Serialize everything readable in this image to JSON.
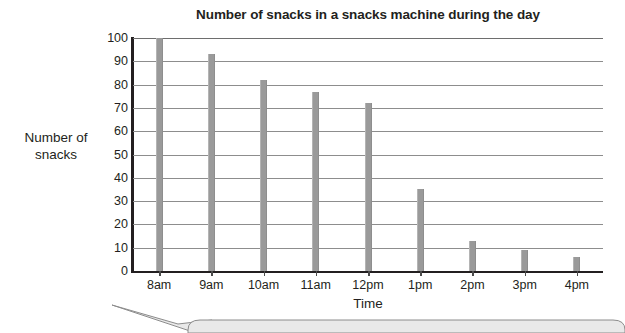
{
  "chart_data": {
    "type": "bar",
    "title": "Number of snacks in a snacks machine during the day",
    "xlabel": "Time",
    "ylabel": "Number of snacks",
    "ylabel_lines": [
      "Number of",
      "snacks"
    ],
    "categories": [
      "8am",
      "9am",
      "10am",
      "11am",
      "12pm",
      "1pm",
      "2pm",
      "3pm",
      "4pm"
    ],
    "values": [
      100,
      93,
      82,
      77,
      72,
      35,
      13,
      9,
      6
    ],
    "ylim": [
      0,
      100
    ],
    "ytick_step": 10,
    "yticks": [
      100,
      90,
      80,
      70,
      60,
      50,
      40,
      30,
      20,
      10,
      0
    ],
    "grid": true,
    "legend": null,
    "bar_color": "#9a9a9a",
    "axis_color": "#231f20",
    "gridline_color": "#8d8d8d",
    "background": "#ffffff"
  },
  "decoration": {
    "callout_fill": "#e9e9e9",
    "callout_stroke": "#8c8c8c"
  }
}
